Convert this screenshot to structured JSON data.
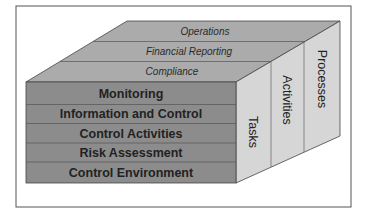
{
  "diagram": {
    "type": "cube",
    "front_face": {
      "rows": [
        {
          "label": "Monitoring"
        },
        {
          "label": "Information and Control"
        },
        {
          "label": "Control Activities"
        },
        {
          "label": "Risk Assessment"
        },
        {
          "label": "Control Environment"
        }
      ]
    },
    "top_face": {
      "rows": [
        {
          "label": "Operations"
        },
        {
          "label": "Financial Reporting"
        },
        {
          "label": "Compliance"
        }
      ]
    },
    "right_face": {
      "columns": [
        {
          "label": "Tasks"
        },
        {
          "label": "Activities"
        },
        {
          "label": "Processes"
        }
      ]
    },
    "colors": {
      "front": "#8c8c8c",
      "top": "#ababab",
      "right": "#d6d6d6",
      "lines": "#444444",
      "frame": "#555555"
    }
  }
}
